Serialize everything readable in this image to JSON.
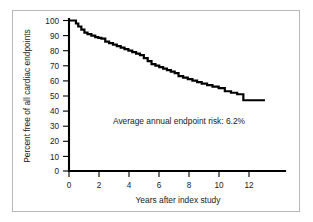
{
  "figure": {
    "background_color": "#ffffff",
    "frame_color": "#b9b9b9",
    "line_color": "#000000"
  },
  "annotation": {
    "text": "Average annual endpoint risk: 6.2%"
  },
  "chart_data": {
    "type": "line",
    "title": "",
    "subtitle": "",
    "xlabel": "Years after index study",
    "ylabel": "Percent free of all cardiac endpoints",
    "xlim": [
      0,
      14
    ],
    "ylim": [
      0,
      100
    ],
    "grid": false,
    "legend": null,
    "xticks": [
      0,
      2,
      4,
      6,
      8,
      10,
      12
    ],
    "xtick_labels": [
      "0",
      "2",
      "4",
      "6",
      "8",
      "10",
      "12"
    ],
    "yticks": [
      0,
      10,
      20,
      30,
      40,
      50,
      60,
      70,
      80,
      90,
      100
    ],
    "ytick_labels": [
      "0",
      "10",
      "20",
      "30",
      "40",
      "50",
      "60",
      "70",
      "80",
      "90",
      "100"
    ],
    "annotations": [
      {
        "text": "Average annual endpoint risk: 6.2%",
        "x": 4.2,
        "y": 33
      }
    ],
    "series": [
      {
        "name": "Percent free of all cardiac endpoints",
        "style": "step",
        "x": [
          0.0,
          0.25,
          0.45,
          0.6,
          0.8,
          1.0,
          1.2,
          1.45,
          1.7,
          1.9,
          2.1,
          2.35,
          2.6,
          2.85,
          3.1,
          3.35,
          3.6,
          3.85,
          4.1,
          4.35,
          4.6,
          4.85,
          5.1,
          5.35,
          5.6,
          5.85,
          6.1,
          6.35,
          6.6,
          6.85,
          7.1,
          7.4,
          7.7,
          8.0,
          8.3,
          8.6,
          8.95,
          9.3,
          9.7,
          10.1,
          10.5,
          10.9,
          11.3,
          12.0,
          12.7
        ],
        "y": [
          100,
          100,
          98,
          96,
          94,
          92,
          91,
          90,
          89,
          88.5,
          88,
          86,
          85,
          84,
          83,
          82,
          81,
          80,
          79,
          78,
          77,
          75,
          73,
          71,
          70,
          69,
          68,
          67,
          66,
          65,
          63,
          62,
          61,
          60,
          59,
          58,
          57,
          56,
          55,
          53,
          52,
          51,
          47,
          47,
          47
        ]
      }
    ]
  }
}
